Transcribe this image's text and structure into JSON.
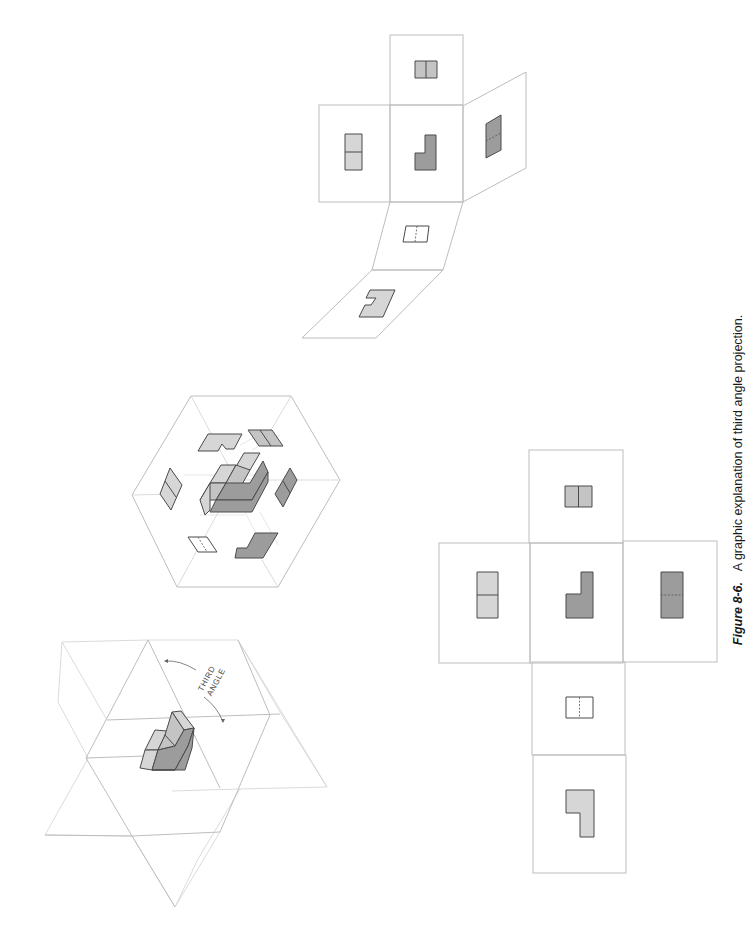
{
  "caption": {
    "figure_number": "Figure 8-6.",
    "text": "A graphic explanation of third angle projection."
  },
  "iso_projection_planes": {
    "label_line1": "THIRD",
    "label_line2": "ANGLE"
  },
  "colors": {
    "plane_lines": "#bdbdbd",
    "light_face": "#d6d6d6",
    "mid_face": "#c4c4c4",
    "dark_face": "#9c9c9c",
    "outline": "#4a4a4a",
    "caption_text": "#1a1a1a"
  },
  "panels": {
    "glass_box": "Glass box with projected views",
    "folding_box": "Partially unfolded glass box",
    "unfolded_box": "Fully unfolded glass box (cross layout)",
    "views": [
      "top view",
      "left side view",
      "front view",
      "right side view",
      "bottom view",
      "rear view"
    ]
  }
}
